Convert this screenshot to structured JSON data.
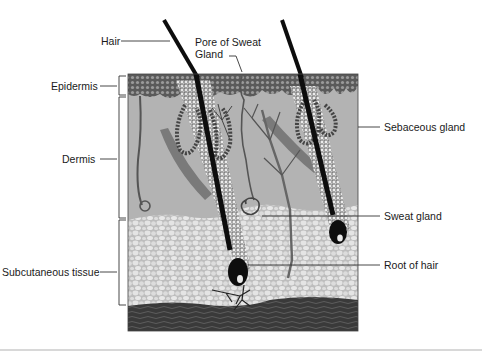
{
  "diagram": {
    "type": "cross-section",
    "layers": [
      {
        "name": "Epidermis",
        "label": "Epidermis"
      },
      {
        "name": "Dermis",
        "label": "Dermis"
      },
      {
        "name": "Subcutaneous tissue",
        "label": "Subcutaneous tissue"
      }
    ],
    "structures": [
      {
        "label": "Hair"
      },
      {
        "label_line1": "Pore of Sweat",
        "label_line2": "Gland"
      },
      {
        "label": "Sebaceous gland"
      },
      {
        "label": "Sweat gland"
      },
      {
        "label": "Root of hair"
      }
    ],
    "colors": {
      "epidermis": "#6e6e6e",
      "dermis": "#b4b4b4",
      "subcutaneous": "#c9c9c9",
      "fat_cell": "#e2e2e2",
      "muscle": "#3c3c3c",
      "hair": "#0d0d0d",
      "line": "#333333"
    }
  },
  "labels": {
    "hair": "Hair",
    "pore_line1": "Pore of Sweat",
    "pore_line2": "Gland",
    "epidermis": "Epidermis",
    "dermis": "Dermis",
    "subcutaneous": "Subcutaneous tissue",
    "sebaceous": "Sebaceous gland",
    "sweat_gland": "Sweat gland",
    "root_of_hair": "Root of hair"
  }
}
